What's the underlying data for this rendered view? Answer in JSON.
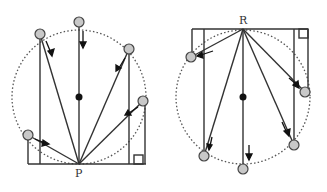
{
  "diagrams": [
    {
      "id": "left",
      "point_label": "P",
      "point": [
        79,
        164
      ],
      "center": [
        79,
        97
      ],
      "radius": 67,
      "balls": [
        [
          79,
          22
        ],
        [
          40,
          34
        ],
        [
          129,
          49
        ],
        [
          143,
          101
        ],
        [
          28,
          135
        ]
      ],
      "description": "Balls sliding along chords of a vertical circle from points on the circle down to the lowest point P"
    },
    {
      "id": "right",
      "point_label": "R",
      "point": [
        243,
        29
      ],
      "center": [
        243,
        97
      ],
      "radius": 67,
      "balls": [
        [
          191,
          57
        ],
        [
          305,
          92
        ],
        [
          204,
          156
        ],
        [
          243,
          169
        ],
        [
          294,
          145
        ]
      ],
      "description": "Balls sliding along chords of a vertical circle from the highest point R down to points on the circle"
    }
  ],
  "colors": {
    "line": "#333333",
    "ball_fill": "#c8c8c8",
    "ball_stroke": "#444444",
    "dot": "#111111",
    "dotted_circle": "#555555"
  }
}
